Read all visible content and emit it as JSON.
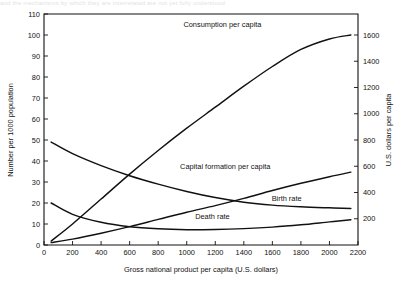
{
  "figure": {
    "page_fragment_top": "and the mechanisms by which they are interrelated are not yet fully understood",
    "background_color": "#ffffff",
    "line_color": "#111111"
  },
  "chart_data": {
    "type": "line",
    "title": "",
    "xlabel": "Gross national product per capita (U.S. dollars)",
    "ylabel": "Number per 1000  population",
    "y2label": "U.S. dollars per capita",
    "xlim": [
      0,
      2200
    ],
    "ylim": [
      0,
      110
    ],
    "y2lim": [
      0,
      1760
    ],
    "grid": false,
    "legend_position": "inline-annotations",
    "xticks": [
      0,
      200,
      400,
      600,
      800,
      1000,
      1200,
      1400,
      1600,
      1800,
      2000,
      2200
    ],
    "xticklabels": [
      "0",
      "200",
      "400",
      "600",
      "800",
      "1000",
      "1200",
      "1400",
      "1600",
      "1800",
      "2000",
      "2200"
    ],
    "yticks": [
      0,
      10,
      20,
      30,
      40,
      50,
      60,
      70,
      80,
      90,
      100,
      110
    ],
    "yticklabels": [
      "0",
      "10",
      "20",
      "30",
      "40",
      "50",
      "60",
      "70",
      "80",
      "90",
      "100",
      "110"
    ],
    "y2ticks": [
      200,
      400,
      600,
      800,
      1000,
      1200,
      1400,
      1600
    ],
    "y2ticklabels": [
      "200",
      "400",
      "600",
      "800",
      "1000",
      "1200",
      "1400",
      "1600"
    ],
    "series": [
      {
        "name": "Consumption per capita",
        "axis": "right",
        "label_x": 1250,
        "label_y": 104,
        "x": [
          50,
          200,
          400,
          600,
          800,
          1000,
          1200,
          1400,
          1600,
          1800,
          2000,
          2150
        ],
        "values_right_axis": [
          30,
          160,
          350,
          540,
          720,
          890,
          1050,
          1210,
          1360,
          1490,
          1570,
          1600
        ],
        "values_left_axis_equivalent": [
          1.9,
          10.0,
          21.9,
          33.8,
          45.0,
          55.6,
          65.6,
          75.6,
          85.0,
          93.1,
          98.1,
          100.0
        ]
      },
      {
        "name": "Capital formation per capita",
        "axis": "right",
        "label_x": 1270,
        "label_y": 36,
        "x": [
          50,
          200,
          400,
          600,
          800,
          1000,
          1200,
          1400,
          1600,
          1800,
          2000,
          2150
        ],
        "values_right_axis": [
          18,
          45,
          90,
          140,
          195,
          250,
          300,
          355,
          415,
          470,
          520,
          555
        ],
        "values_left_axis_equivalent": [
          1.1,
          2.8,
          5.6,
          8.8,
          12.2,
          15.6,
          18.8,
          22.2,
          25.9,
          29.4,
          32.5,
          34.7
        ]
      },
      {
        "name": "Birth rate",
        "axis": "left",
        "label_x": 1700,
        "label_y": 21,
        "x": [
          50,
          200,
          400,
          600,
          800,
          1000,
          1200,
          1400,
          1600,
          1800,
          2000,
          2150
        ],
        "values": [
          49.0,
          43.5,
          37.8,
          33.0,
          29.0,
          25.5,
          22.6,
          20.4,
          19.0,
          18.2,
          17.7,
          17.4
        ]
      },
      {
        "name": "Death rate",
        "axis": "left",
        "label_x": 1180,
        "label_y": 12.5,
        "x": [
          50,
          200,
          400,
          600,
          800,
          1000,
          1200,
          1400,
          1600,
          1800,
          2000,
          2150
        ],
        "values": [
          20.0,
          14.6,
          10.8,
          8.7,
          7.7,
          7.3,
          7.4,
          7.8,
          8.5,
          9.6,
          11.0,
          12.0
        ]
      }
    ],
    "annotations": [
      {
        "text": "Consumption per capita",
        "x": 1250,
        "y": 104
      },
      {
        "text": "Capital formation per capita",
        "x": 1270,
        "y": 36
      },
      {
        "text": "Birth rate",
        "x": 1700,
        "y": 21
      },
      {
        "text": "Death rate",
        "x": 1180,
        "y": 12.5
      }
    ]
  }
}
